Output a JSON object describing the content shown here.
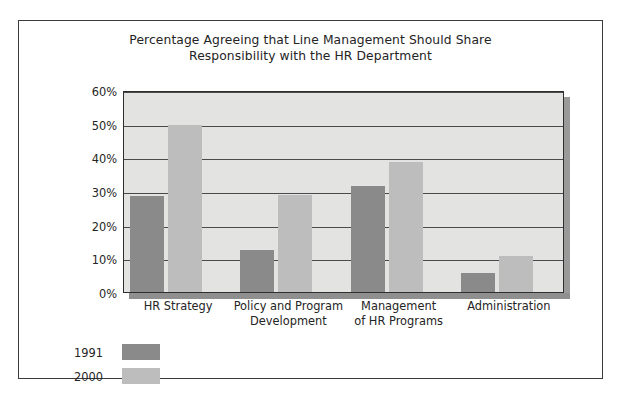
{
  "chart_data": {
    "type": "bar",
    "title": "Percentage Agreeing that Line Management Should Share Responsibility with the HR Department",
    "title_line1": "Percentage Agreeing that Line Management Should Share",
    "title_line2": "Responsibility with the HR Department",
    "xlabel": "",
    "ylabel": "",
    "ylim": [
      0,
      60
    ],
    "ytick_labels": [
      "0%",
      "10%",
      "20%",
      "30%",
      "40%",
      "50%",
      "60%"
    ],
    "ytick_values": [
      0,
      10,
      20,
      30,
      40,
      50,
      60
    ],
    "grid": true,
    "legend_position": "below-left",
    "categories": [
      "HR Strategy",
      "Policy and Program Development",
      "Management of HR Programs",
      "Administration"
    ],
    "category_lines": [
      [
        "HR Strategy"
      ],
      [
        "Policy and Program",
        "Development"
      ],
      [
        "Management",
        "of HR Programs"
      ],
      [
        "Administration"
      ]
    ],
    "series": [
      {
        "name": "1991",
        "color": "#8a8a8a",
        "values": [
          28.5,
          12.5,
          31.5,
          5.5
        ]
      },
      {
        "name": "2000",
        "color": "#bdbdbd",
        "values": [
          49.5,
          28.8,
          38.5,
          10.8
        ]
      }
    ]
  },
  "colors": {
    "series_1991": "#8a8a8a",
    "series_2000": "#bdbdbd",
    "plot_background": "#e3e3e1",
    "gridline": "#4a4a4a",
    "frame_border": "#3b3b3b",
    "depth_shadow": "#9a9a9a"
  }
}
